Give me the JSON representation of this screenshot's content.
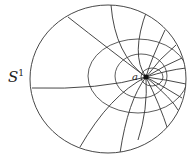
{
  "figure": {
    "labels": {
      "circle_label": "S",
      "circle_label_sup": "1",
      "point_label": "a"
    },
    "colors": {
      "stroke": "#333333",
      "background": "#ffffff"
    },
    "outer_circle": {
      "cx": 108,
      "cy": 79,
      "rx": 78,
      "ry": 74
    },
    "focal_point": {
      "x": 146,
      "y": 77
    }
  }
}
